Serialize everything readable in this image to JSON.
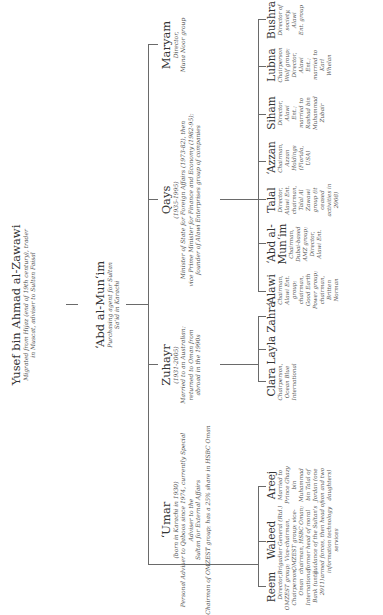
{
  "root": {
    "name": "Yusef bin Ahmad al-Zawawi",
    "note_lines": [
      "Migrated from Hijaz (end of 19th century), trader",
      "in Muscat, adviser to Sultan Faisal"
    ]
  },
  "founder": {
    "name": "‘Abd al-Mun‘im",
    "note_lines": [
      "Purchasing agent for Sultan",
      "Sa‘id in Karachi"
    ]
  },
  "children": [
    {
      "name": "‘Umar",
      "note_lines": [
        "(born in Karachi in 1930)",
        "Personal Adviser to Qaboos since 1974, currently Special Adviser to the",
        "Sultan for External Affairs",
        "Chairman of OMZEST group; has a 25% share in HSBC Oman"
      ],
      "children": [
        {
          "name": "Reem",
          "note_lines": [
            "Director,",
            "OMZEST group;",
            "Chairperson,",
            "Oman",
            "International",
            "Bank (until",
            "2011)"
          ]
        },
        {
          "name": "Waleed",
          "note_lines": [
            "Brigadier General (Rtd.)",
            "Vice-chairman,",
            "OMZEST group; vice-",
            "chairman, HSBC Oman;",
            "former head of moral",
            "guidance of the Sultan's",
            "armed forces, then head of",
            "information technology",
            "services"
          ]
        },
        {
          "name": "Areej",
          "note_lines": [
            "Married to",
            "Prince Ghazy",
            "bin",
            "Muhammad",
            "bin Talal of",
            "Jordan (one",
            "son and two",
            "daughters)"
          ]
        }
      ]
    },
    {
      "name": "Zuhayr",
      "note_lines": [
        "(1931-2005)",
        "Married to an Australian;",
        "returned to Oman from",
        "abroad in the 1990s"
      ],
      "children": [
        {
          "name": "Clara",
          "note_lines": [
            "Chairperson,",
            "Ocean Blue",
            "International"
          ]
        },
        {
          "name": "Layla",
          "note_lines": []
        },
        {
          "name": "Zahra",
          "note_lines": []
        }
      ]
    },
    {
      "name": "Qays",
      "note_lines": [
        "(1935-1995)",
        "Minister of State for Foreign Affairs (1973-82), then",
        "vice Prime Minister for Finance and Economy (1982-95);",
        "founder of Alawi Enterprises group of companies"
      ],
      "children": [
        {
          "name": "‘Alawi",
          "note_lines": [
            "Chairman,",
            "Alawi Ent.",
            "group;",
            "chairman,",
            "Good Earth",
            "Power group;",
            "chairman,",
            "Britten",
            "Norman"
          ]
        },
        {
          "name": "‘Abd al-Mun‘im",
          "note_lines": [
            "Chairman,",
            "Dubai-based",
            "AMZ group;",
            "Director,",
            "Alawi Ent."
          ]
        },
        {
          "name": "Talal",
          "note_lines": [
            "Director,",
            "Alawi Ent.",
            "chairman,",
            "Talal Al",
            "Zawawi",
            "group (it",
            "ceased",
            "activities in",
            "2008)"
          ]
        },
        {
          "name": "‘Azzan",
          "note_lines": [
            "Chairman,",
            "Azzan",
            "Holdings",
            "(Florida,",
            "USA)"
          ]
        },
        {
          "name": "Siham",
          "note_lines": [
            "Director,",
            "Alawi",
            "Ent.;",
            "married to",
            "Rashad bin",
            "Muhammad",
            "Zubair"
          ]
        },
        {
          "name": "Lubna",
          "note_lines": [
            "Chairperson",
            "Wolf group;",
            "Director,",
            "Alawi",
            "Ent.;",
            "married to",
            "Karl",
            "Whelan"
          ]
        },
        {
          "name": "Bushra",
          "note_lines": [
            "Director of",
            "society,",
            "Alawi",
            "Ent. group"
          ]
        }
      ]
    },
    {
      "name": "Maryam",
      "note_lines": [
        "Director,",
        "Muna Noor group"
      ],
      "children": []
    }
  ],
  "colors": {
    "line": "#6a6a6a",
    "text": "#333333",
    "background": "#ffffff"
  }
}
